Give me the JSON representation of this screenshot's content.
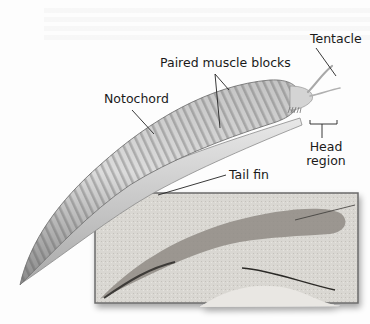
{
  "figure": {
    "labels": {
      "tentacle": "Tentacle",
      "paired_muscle_blocks": "Paired muscle blocks",
      "notochord": "Notochord",
      "head_region_line1": "Head",
      "head_region_line2": "region",
      "tail_fin": "Tail fin"
    },
    "colors": {
      "body_light": "#e6e6e6",
      "body_mid": "#b9b9b9",
      "body_dark": "#7d7d7d",
      "fossil_bg": "#d8d6d2",
      "fossil_body": "#8e8a84",
      "leader_line": "#222222"
    }
  }
}
